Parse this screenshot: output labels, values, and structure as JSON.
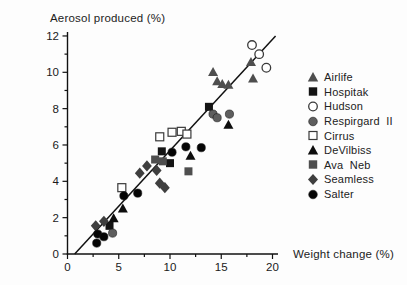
{
  "figure": {
    "y_axis_title": "Aerosol produced (%)",
    "x_axis_title": "Weight change (%)"
  },
  "colors": {
    "axis": "#111111",
    "trend_line": "#111111",
    "gray_marker": "#4e4e4e",
    "mid_gray_marker": "#5e5e5e",
    "black_marker": "#0d0d0d",
    "open_marker_stroke": "#3a3a3a",
    "text": "#1a1a1a"
  },
  "chart_data": {
    "type": "scatter",
    "title": "",
    "xlabel": "Weight change (%)",
    "ylabel": "Aerosol produced (%)",
    "xlim": [
      0,
      20
    ],
    "ylim": [
      0,
      12
    ],
    "x_major_ticks": [
      0,
      5,
      10,
      15,
      20
    ],
    "x_minor_step": 2.5,
    "y_major_ticks": [
      0,
      2,
      4,
      6,
      8,
      10,
      12
    ],
    "y_minor_step": 1,
    "grid": false,
    "legend_position": "right",
    "trend_line": {
      "x1": 0.7,
      "y1": 0.0,
      "x2": 20.3,
      "y2": 12.0
    },
    "series": [
      {
        "name": "Airlife",
        "marker": "triangle",
        "fill": "#4e4e4e",
        "points": [
          [
            14.2,
            10.0
          ],
          [
            14.6,
            9.5
          ],
          [
            15.1,
            9.35
          ],
          [
            15.7,
            9.3
          ],
          [
            17.9,
            10.55
          ],
          [
            18.1,
            9.65
          ]
        ]
      },
      {
        "name": "Hospitak",
        "marker": "square",
        "fill": "#141414",
        "points": [
          [
            13.8,
            8.1
          ],
          [
            9.2,
            5.65
          ],
          [
            10.0,
            5.0
          ],
          [
            4.1,
            1.55
          ]
        ]
      },
      {
        "name": "Hudson",
        "marker": "circle-open",
        "fill": "#ffffff",
        "points": [
          [
            18.0,
            11.5
          ],
          [
            18.7,
            11.0
          ],
          [
            19.4,
            10.25
          ]
        ]
      },
      {
        "name": "Respirgard  II",
        "marker": "circle",
        "fill": "#5e5e5e",
        "points": [
          [
            14.2,
            7.7
          ],
          [
            14.6,
            7.5
          ],
          [
            15.8,
            7.7
          ],
          [
            4.4,
            1.15
          ]
        ]
      },
      {
        "name": "Cirrus",
        "marker": "square-open",
        "fill": "#ffffff",
        "points": [
          [
            9.0,
            6.45
          ],
          [
            10.2,
            6.7
          ],
          [
            11.1,
            6.75
          ],
          [
            11.65,
            6.6
          ],
          [
            5.3,
            3.65
          ]
        ]
      },
      {
        "name": "DeVilbiss",
        "marker": "triangle",
        "fill": "#0d0d0d",
        "points": [
          [
            15.7,
            7.1
          ],
          [
            12.0,
            5.4
          ],
          [
            5.4,
            2.5
          ],
          [
            4.5,
            1.95
          ]
        ]
      },
      {
        "name": "Ava  Neb",
        "marker": "square",
        "fill": "#4e4e4e",
        "points": [
          [
            8.55,
            5.2
          ],
          [
            9.3,
            5.1
          ],
          [
            11.8,
            4.55
          ]
        ]
      },
      {
        "name": "Seamless",
        "marker": "diamond",
        "fill": "#3f3f3f",
        "points": [
          [
            7.75,
            4.85
          ],
          [
            8.7,
            4.6
          ],
          [
            7.05,
            4.45
          ],
          [
            9.0,
            3.9
          ],
          [
            9.5,
            3.65
          ],
          [
            3.55,
            1.8
          ],
          [
            2.75,
            1.55
          ]
        ]
      },
      {
        "name": "Salter",
        "marker": "circle",
        "fill": "#050505",
        "points": [
          [
            2.95,
            1.1
          ],
          [
            3.55,
            0.95
          ],
          [
            2.85,
            0.6
          ],
          [
            5.5,
            3.2
          ],
          [
            6.85,
            3.35
          ],
          [
            10.2,
            5.6
          ],
          [
            11.55,
            5.9
          ],
          [
            13.05,
            5.85
          ]
        ]
      }
    ]
  }
}
